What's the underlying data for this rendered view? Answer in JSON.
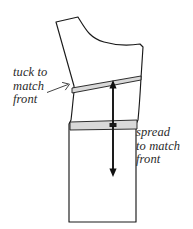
{
  "diagram": {
    "type": "sewing-pattern-alteration",
    "background_color": "#ffffff",
    "outline_color": "#1a1a1a",
    "band_fill_color": "#d9d9d9",
    "band_stroke_color": "#1a1a1a",
    "arrow_color": "#111111",
    "text_color": "#2b2b2b"
  },
  "annotations": {
    "tuck": {
      "line1": "tuck to",
      "line2": "match",
      "line3": "front",
      "full_text": "tuck to match front",
      "leader": "leader-arrow-up-right",
      "target": "tuck-band"
    },
    "spread": {
      "line1": "spread",
      "line2": "to match",
      "line3": "front",
      "full_text": "spread to match front",
      "target": "spread-band"
    }
  },
  "shapes": {
    "pattern_outline": {
      "name": "trouser-back-leg-outline",
      "path": "M 56 22 L 78 17 C 86 30 90 38 104 42 C 118 46 128 46 140 44 L 143 47 L 141 78 C 140 96 139 110 138 120 L 136 124 L 136 222 L 69 222 L 69 124 L 71 120 C 72 112 73 100 74 92 L 74 86 Z"
    },
    "tuck_band": {
      "name": "tuck-wedge-band",
      "path": "M 72 88 L 141 76 L 141 80 L 72 93 Z",
      "description": "thin slanted wedge across hip, wider at left"
    },
    "spread_band": {
      "name": "spread-rectangle-band",
      "path": "M 70 122 L 137 120 L 137 129 L 70 130 Z",
      "description": "horizontal band across thigh"
    }
  },
  "arrows": {
    "up_arrow": {
      "name": "up-arrow-to-tuck",
      "x": 113,
      "y_tail": 124,
      "y_head": 82,
      "direction": "up"
    },
    "down_arrow": {
      "name": "down-arrow-from-spread",
      "x": 113,
      "y_tail": 126,
      "y_head": 176,
      "direction": "down"
    },
    "leader_arrow": {
      "name": "tuck-leader-arrow",
      "x_tail": 47,
      "y_tail": 92,
      "x_head": 70,
      "y_head": 84,
      "direction": "up-right"
    }
  }
}
